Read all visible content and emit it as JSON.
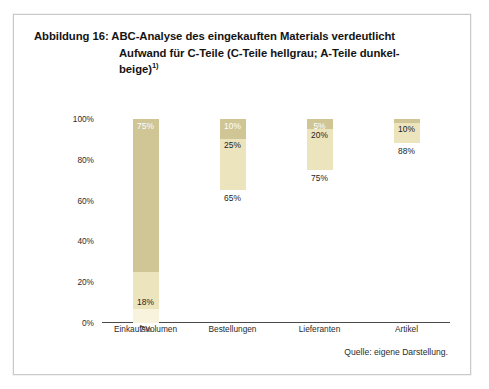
{
  "figure": {
    "label": "Abbildung 16:",
    "title_line1": "ABC-Analyse des eingekauften Materials verdeutlicht",
    "title_line2": "Aufwand für C-Teile (C-Teile hellgrau; A-Teile dunkel-",
    "title_line3": "beige)",
    "title_footnote": "1)",
    "source_note": "Quelle: eigene Darstellung."
  },
  "colors": {
    "a_teile_dark_beige": "#cfc595",
    "b_teile_mid_beige": "#ece4bd",
    "c_teile_light": "#f7f3dc",
    "axis": "#4a4a4a",
    "frame": "#c9c9c9",
    "text": "#1b1b1b",
    "background": "#ffffff"
  },
  "chart_data": {
    "type": "bar",
    "subtitle": "",
    "xlabel": "",
    "ylabel": "",
    "stacked": true,
    "grid": false,
    "legend_position": "none",
    "ylim": [
      0,
      100
    ],
    "yticks": [
      0,
      20,
      40,
      60,
      80,
      100
    ],
    "ytick_labels": [
      "0%",
      "20%",
      "40%",
      "60%",
      "80%",
      "100%"
    ],
    "categories": [
      "Einkaufsvolumen",
      "Bestellungen",
      "Lieferanten",
      "Artikel"
    ],
    "series": [
      {
        "name": "A-Teile (dunkelbeige)",
        "color": "#cfc595",
        "values": [
          75,
          10,
          5,
          2
        ],
        "value_labels": [
          "75%",
          "10%",
          "5%",
          "2%"
        ]
      },
      {
        "name": "B-Teile (mittelbeige)",
        "color": "#ece4bd",
        "values": [
          18,
          25,
          20,
          10
        ],
        "value_labels": [
          "18%",
          "25%",
          "20%",
          "10%"
        ]
      },
      {
        "name": "C-Teile (hellgrau)",
        "color": "#f7f3dc",
        "values": [
          7,
          65,
          75,
          88
        ],
        "value_labels": [
          "7%",
          "65%",
          "75%",
          "88%"
        ]
      }
    ],
    "bars": [
      {
        "category": "Einkaufsvolumen",
        "full_height_drawn": true,
        "segments": [
          {
            "name": "A-Teile",
            "value": 75,
            "label": "75%"
          },
          {
            "name": "B-Teile",
            "value": 18,
            "label": "18%"
          },
          {
            "name": "C-Teile",
            "value": 7,
            "label": "7%"
          }
        ]
      },
      {
        "category": "Bestellungen",
        "full_height_drawn": false,
        "segments": [
          {
            "name": "A-Teile",
            "value": 10,
            "label": "10%"
          },
          {
            "name": "B-Teile",
            "value": 25,
            "label": "25%"
          },
          {
            "name": "C-Teile",
            "value": 65,
            "label": "65%"
          }
        ]
      },
      {
        "category": "Lieferanten",
        "full_height_drawn": false,
        "segments": [
          {
            "name": "A-Teile",
            "value": 5,
            "label": "5%"
          },
          {
            "name": "B-Teile",
            "value": 20,
            "label": "20%"
          },
          {
            "name": "C-Teile",
            "value": 75,
            "label": "75%"
          }
        ]
      },
      {
        "category": "Artikel",
        "full_height_drawn": false,
        "segments": [
          {
            "name": "A-Teile",
            "value": 2,
            "label": "2%"
          },
          {
            "name": "B-Teile",
            "value": 10,
            "label": "10%"
          },
          {
            "name": "C-Teile",
            "value": 88,
            "label": "88%"
          }
        ]
      }
    ]
  }
}
